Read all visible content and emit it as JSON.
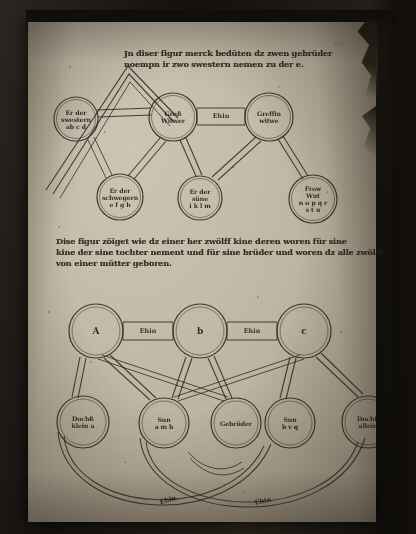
{
  "page": {
    "kind": "medieval-manuscript-leaf",
    "folio_mark": "f.16",
    "ink_color": "#241c12",
    "vellum_color": "#c3bba9"
  },
  "diagram_one": {
    "heading": {
      "line1": "Jn diser figur merck bedüten dz zwen gebrüder",
      "line2": "noempn ir zwo swestern nemen zu der e."
    },
    "nodes": [
      {
        "id": "n1",
        "lines": [
          "Er der",
          "swestern",
          "ab c d"
        ],
        "cx": 48,
        "cy": 97,
        "r": 22
      },
      {
        "id": "n2",
        "lines": [
          "Groß",
          "Witwer"
        ],
        "cx": 145,
        "cy": 95,
        "r": 24
      },
      {
        "id": "n3",
        "lines": [
          "Greffin",
          "witwe"
        ],
        "cx": 241,
        "cy": 95,
        "r": 24
      },
      {
        "id": "n4",
        "lines": [
          "Er der",
          "schwegern",
          "e f g h"
        ],
        "cx": 92,
        "cy": 175,
        "r": 23
      },
      {
        "id": "n5",
        "lines": [
          "Er der",
          "süne",
          "i k l m"
        ],
        "cx": 172,
        "cy": 176,
        "r": 22
      },
      {
        "id": "n6",
        "lines": [
          "Frow",
          "Wut",
          "n o p q r",
          "s t u"
        ],
        "cx": 285,
        "cy": 177,
        "r": 24
      }
    ],
    "band_labels": [
      {
        "text": "Ehin",
        "cx": 193,
        "cy": 94
      }
    ]
  },
  "diagram_two": {
    "heading": {
      "line1": "Dise figur zöiget wie dz einer her zwölff kine deren woren für sine",
      "line2": "kine der sine tochter nement und für sine brüder und woren dz alle zwölff",
      "line3": "von einer mütter geboren."
    },
    "nodes": [
      {
        "id": "m1",
        "lines": [
          "A"
        ],
        "cx": 68,
        "cy": 309,
        "r": 27,
        "big": true
      },
      {
        "id": "m2",
        "lines": [
          "b"
        ],
        "cx": 172,
        "cy": 309,
        "r": 27,
        "big": true
      },
      {
        "id": "m3",
        "lines": [
          "c"
        ],
        "cx": 276,
        "cy": 309,
        "r": 27,
        "big": true
      },
      {
        "id": "m4",
        "lines": [
          "Dochß",
          "klein a"
        ],
        "cx": 55,
        "cy": 400,
        "r": 26
      },
      {
        "id": "m5",
        "lines": [
          "Sun",
          "a m b"
        ],
        "cx": 136,
        "cy": 401,
        "r": 25
      },
      {
        "id": "m6",
        "lines": [
          "Gebrüder"
        ],
        "cx": 208,
        "cy": 401,
        "r": 25
      },
      {
        "id": "m7",
        "lines": [
          "Sun",
          "b v q"
        ],
        "cx": 262,
        "cy": 401,
        "r": 25
      },
      {
        "id": "m8",
        "lines": [
          "Dochß",
          "allein"
        ],
        "cx": 340,
        "cy": 400,
        "r": 26
      }
    ],
    "band_labels": [
      {
        "text": "Ehin",
        "cx": 120,
        "cy": 309
      },
      {
        "text": "Ehin",
        "cx": 224,
        "cy": 309
      },
      {
        "text": "Ehin",
        "cx": 140,
        "cy": 478
      },
      {
        "text": "Ehin",
        "cx": 235,
        "cy": 479
      }
    ]
  }
}
